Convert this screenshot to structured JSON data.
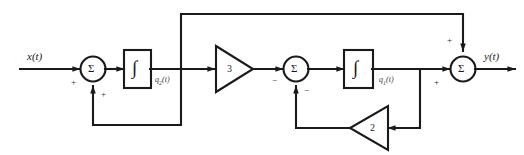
{
  "diagram": {
    "line_color": "#1a1a1a",
    "background": "#ffffff",
    "signals": {
      "input": "x(t)",
      "output": "y(t)",
      "state_2": "q",
      "state_2_sub": "2",
      "state_2_suffix": "(t)",
      "state_1": "q",
      "state_1_sub": "1",
      "state_1_suffix": "(t)"
    },
    "summers": [
      {
        "name": "summer-1",
        "symbol": "Σ",
        "sign_left": "+",
        "sign_bottom": "+"
      },
      {
        "name": "summer-2",
        "symbol": "Σ",
        "sign_left": "−",
        "sign_bottom": "−"
      },
      {
        "name": "summer-3",
        "symbol": "Σ",
        "sign_left": "+",
        "sign_top": "+"
      }
    ],
    "integrators": [
      {
        "name": "integrator-1",
        "symbol": "∫"
      },
      {
        "name": "integrator-2",
        "symbol": "∫"
      }
    ],
    "gains": [
      {
        "name": "gain-3",
        "value": "3",
        "direction": "right"
      },
      {
        "name": "gain-2",
        "value": "2",
        "direction": "left"
      }
    ]
  }
}
